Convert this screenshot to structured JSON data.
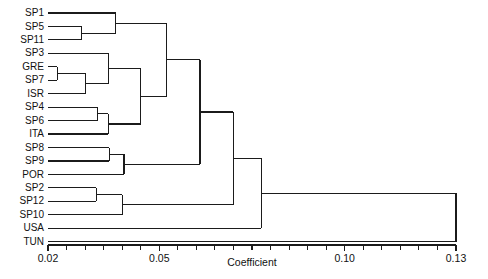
{
  "chart_data": {
    "type": "dendrogram",
    "title": "",
    "xlabel": "Coefficient",
    "ylabel": "",
    "xlim": [
      0.02,
      0.13
    ],
    "grid": false,
    "legend": "none",
    "orientation": "horizontal-right",
    "axis": {
      "major_ticks": [
        0.02,
        0.05,
        0.1,
        0.13
      ],
      "major_tick_labels": [
        "0.02",
        "0.05",
        "0.10",
        "0.13"
      ],
      "minor_tick_step": 0.005,
      "minor_ticks": [
        0.02,
        0.025,
        0.03,
        0.035,
        0.04,
        0.045,
        0.05,
        0.055,
        0.06,
        0.065,
        0.07,
        0.075,
        0.08,
        0.085,
        0.09,
        0.095,
        0.1,
        0.105,
        0.11,
        0.115,
        0.12,
        0.125,
        0.13
      ]
    },
    "leaves": [
      "SP1",
      "SP5",
      "SP11",
      "SP3",
      "GRE",
      "SP7",
      "ISR",
      "SP4",
      "SP6",
      "ITA",
      "SP8",
      "SP9",
      "POR",
      "SP2",
      "SP12",
      "SP10",
      "USA",
      "TUN"
    ],
    "leaf_order": [
      "SP1",
      "SP5",
      "SP11",
      "SP3",
      "GRE",
      "SP7",
      "ISR",
      "SP4",
      "SP6",
      "ITA",
      "SP8",
      "SP9",
      "POR",
      "SP2",
      "SP12",
      "SP10",
      "USA",
      "TUN"
    ],
    "merges": [
      {
        "name": "GRE+SP7",
        "members": [
          "GRE",
          "SP7"
        ],
        "coefficient": 0.0225
      },
      {
        "name": "SP5+SP11",
        "members": [
          "SP5",
          "SP11"
        ],
        "coefficient": 0.029
      },
      {
        "name": "SP4+SP6",
        "members": [
          "SP4",
          "SP6"
        ],
        "coefficient": 0.0333
      },
      {
        "name": "SP2+SP12",
        "members": [
          "SP2",
          "SP12"
        ],
        "coefficient": 0.033
      },
      {
        "name": "GRE+SP7+ISR",
        "members": [
          "GRE",
          "SP7",
          "ISR"
        ],
        "coefficient": 0.0302
      },
      {
        "name": "SP4+SP6+ITA",
        "members": [
          "SP4",
          "SP6",
          "ITA"
        ],
        "coefficient": 0.0363
      },
      {
        "name": "SP8+SP9",
        "members": [
          "SP8",
          "SP9"
        ],
        "coefficient": 0.0365
      },
      {
        "name": "SP1+SP5+SP11",
        "members": [
          "SP1",
          "SP5",
          "SP11"
        ],
        "coefficient": 0.0382
      },
      {
        "name": "SP3-group",
        "members": [
          "SP3",
          "GRE",
          "SP7",
          "ISR"
        ],
        "coefficient": 0.0363
      },
      {
        "name": "SP8+SP9+POR",
        "members": [
          "SP8",
          "SP9",
          "POR"
        ],
        "coefficient": 0.0405
      },
      {
        "name": "SP2+SP12+SP10",
        "members": [
          "SP2",
          "SP12",
          "SP10"
        ],
        "coefficient": 0.04
      },
      {
        "name": "mediterranean-core",
        "members": [
          "SP3",
          "GRE",
          "SP7",
          "ISR",
          "SP4",
          "SP6",
          "ITA"
        ],
        "coefficient": 0.045
      },
      {
        "name": "upper-clade",
        "members": [
          "SP1",
          "SP5",
          "SP11",
          "SP3",
          "GRE",
          "SP7",
          "ISR",
          "SP4",
          "SP6",
          "ITA"
        ],
        "coefficient": 0.052
      },
      {
        "name": "upper+POR-clade",
        "members": [
          "SP1",
          "SP5",
          "SP11",
          "SP3",
          "GRE",
          "SP7",
          "ISR",
          "SP4",
          "SP6",
          "ITA",
          "SP8",
          "SP9",
          "POR"
        ],
        "coefficient": 0.061
      },
      {
        "name": "main-clade",
        "members": [
          "SP1",
          "SP5",
          "SP11",
          "SP3",
          "GRE",
          "SP7",
          "ISR",
          "SP4",
          "SP6",
          "ITA",
          "SP8",
          "SP9",
          "POR",
          "SP2",
          "SP12",
          "SP10"
        ],
        "coefficient": 0.07
      },
      {
        "name": "main+USA",
        "members": [
          "main-clade",
          "USA"
        ],
        "coefficient": 0.0775
      },
      {
        "name": "root",
        "members": [
          "main+USA",
          "TUN"
        ],
        "coefficient": 0.13
      }
    ]
  },
  "figure": {
    "axis_title": "Coefficient",
    "tick_labels": [
      "0.02",
      "0.05",
      "0.10",
      "0.13"
    ],
    "leaf_labels": [
      "SP1",
      "SP5",
      "SP11",
      "SP3",
      "GRE",
      "SP7",
      "ISR",
      "SP4",
      "SP6",
      "ITA",
      "SP8",
      "SP9",
      "POR",
      "SP2",
      "SP12",
      "SP10",
      "USA",
      "TUN"
    ],
    "colors": {
      "line": "#1b1b1b",
      "text": "#111111",
      "background": "#ffffff"
    }
  }
}
